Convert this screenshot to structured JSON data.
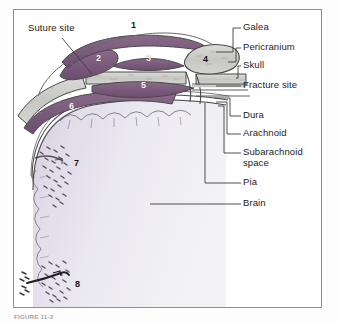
{
  "figure": {
    "caption": "FIGURE 11-2",
    "border_color": "#8e8e8e",
    "background": "#ffffff"
  },
  "palette": {
    "tissue_purple": "#7d5e7c",
    "tissue_purple_dark": "#6b4f6c",
    "bone_gray": "#c8c9c4",
    "bone_gray_light": "#d8d9d4",
    "brain_fill": "#e6e3ec",
    "brain_edge": "#bfb8cb",
    "outline": "#4a4a4a",
    "label_text": "#1b1b1b",
    "leader_line": "#3d3d3d"
  },
  "left_labels": [
    {
      "id": "suture-site",
      "text": "Suture site",
      "x": 28,
      "y": 28
    }
  ],
  "right_labels": [
    {
      "id": "galea",
      "text": "Galea",
      "x": 243,
      "y": 27,
      "wrap": false
    },
    {
      "id": "pericranium",
      "text": "Pericranium",
      "x": 243,
      "y": 47,
      "wrap": false
    },
    {
      "id": "skull",
      "text": "Skull",
      "x": 243,
      "y": 65,
      "wrap": false
    },
    {
      "id": "fracture-site",
      "text": "Fracture site",
      "x": 243,
      "y": 85,
      "wrap": false
    },
    {
      "id": "dura",
      "text": "Dura",
      "x": 243,
      "y": 115,
      "wrap": false
    },
    {
      "id": "arachnoid",
      "text": "Arachnoid",
      "x": 243,
      "y": 133,
      "wrap": false
    },
    {
      "id": "subarachnoid-space",
      "text": "Subarachnoid space",
      "x": 243,
      "y": 152,
      "wrap": true
    },
    {
      "id": "pia",
      "text": "Pia",
      "x": 243,
      "y": 182,
      "wrap": false
    },
    {
      "id": "brain",
      "text": "Brain",
      "x": 243,
      "y": 203,
      "wrap": false
    }
  ],
  "callouts": [
    {
      "id": "callout-1",
      "text": "1",
      "x": 131,
      "y": 24,
      "light": false
    },
    {
      "id": "callout-2",
      "text": "2",
      "x": 96,
      "y": 57,
      "light": true
    },
    {
      "id": "callout-3",
      "text": "3",
      "x": 146,
      "y": 57,
      "light": true
    },
    {
      "id": "callout-4",
      "text": "4",
      "x": 203,
      "y": 58,
      "light": false
    },
    {
      "id": "callout-5",
      "text": "5",
      "x": 141,
      "y": 84,
      "light": true
    },
    {
      "id": "callout-6",
      "text": "6",
      "x": 69,
      "y": 105,
      "light": true
    },
    {
      "id": "callout-7",
      "text": "7",
      "x": 74,
      "y": 162,
      "light": false
    },
    {
      "id": "callout-8",
      "text": "8",
      "x": 75,
      "y": 283,
      "light": false
    }
  ]
}
